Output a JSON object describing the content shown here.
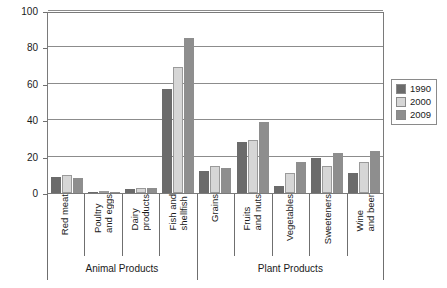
{
  "chart_data": {
    "type": "bar",
    "title": "",
    "subtitle": "",
    "xlabel": "",
    "ylabel": "",
    "ylim": [
      0,
      100
    ],
    "yticks": [
      0,
      20,
      40,
      60,
      80,
      100
    ],
    "grid": true,
    "legend_position": "right",
    "categories": [
      "Red meat",
      "Poultry\nand eggs",
      "Dairy\nproducts",
      "Fish and\nshellfish",
      "Grains",
      "Fruits\nand nuts",
      "Vegetables",
      "Sweeteners",
      "Wine\nand beer"
    ],
    "groups": [
      {
        "label": "Animal Products",
        "categories": [
          "Red meat",
          "Poultry and eggs",
          "Dairy products",
          "Fish and shellfish"
        ]
      },
      {
        "label": "Plant Products",
        "categories": [
          "Grains",
          "Fruits and nuts",
          "Vegetables",
          "Sweeteners",
          "Wine and beer"
        ]
      }
    ],
    "series": [
      {
        "name": "1990",
        "color": "#6b6b6b",
        "values": [
          9,
          0.5,
          2,
          57,
          12,
          28,
          4,
          19,
          11
        ]
      },
      {
        "name": "2000",
        "color": "#d6d6d6",
        "values": [
          10,
          0.5,
          3,
          69,
          15,
          29,
          11,
          15,
          17
        ]
      },
      {
        "name": "2009",
        "color": "#8e8e8e",
        "values": [
          8,
          0.5,
          3,
          85,
          14,
          39,
          17,
          22,
          23
        ]
      }
    ]
  },
  "legend": {
    "items": [
      {
        "label": "1990",
        "color": "#6b6b6b"
      },
      {
        "label": "2000",
        "color": "#d6d6d6"
      },
      {
        "label": "2009",
        "color": "#8e8e8e"
      }
    ]
  }
}
